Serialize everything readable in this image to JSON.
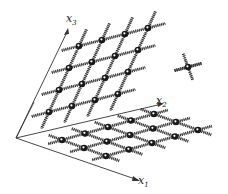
{
  "figure": {
    "axes": [
      {
        "name": "x1",
        "label": "x",
        "subscript": "1"
      },
      {
        "name": "x2",
        "label": "x",
        "subscript": "2"
      },
      {
        "name": "x3",
        "label": "x",
        "subscript": "3"
      }
    ],
    "vertical_lattice": {
      "rows": 4,
      "cols": 4
    },
    "base_lattice": {
      "rows": 4,
      "cols": 5
    },
    "isolated_node": {
      "bonds": 6
    }
  },
  "colors": {
    "ink": "#1a1a1a",
    "bond": "#2a2a2a",
    "background": "#ffffff"
  }
}
